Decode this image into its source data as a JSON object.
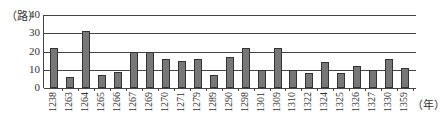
{
  "chart_data": {
    "type": "bar",
    "title": "",
    "ylabel": "（路）",
    "xlabel": "（年）",
    "ylim": [
      0,
      40
    ],
    "yticks": [
      0,
      10,
      20,
      30,
      40
    ],
    "grid": true,
    "legend": null,
    "categories": [
      "1238",
      "1263",
      "1264",
      "1265",
      "1266",
      "1267",
      "1269",
      "1270",
      "1271",
      "1279",
      "1289",
      "1290",
      "1298",
      "1301",
      "1309",
      "1310",
      "1322",
      "1324",
      "1325",
      "1326",
      "1327",
      "1330",
      "1359"
    ],
    "values": [
      22,
      6,
      31,
      7,
      9,
      20,
      20,
      16,
      15,
      16,
      7,
      17,
      22,
      10,
      22,
      10,
      8,
      14,
      8,
      12,
      10,
      16,
      11
    ],
    "bar_color": "#777777"
  }
}
